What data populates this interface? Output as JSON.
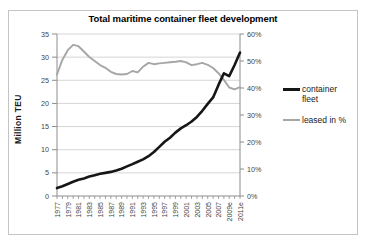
{
  "chart_data": {
    "type": "line",
    "title": "Total maritime container fleet development",
    "ylabel_left": "Million TEU",
    "x": [
      1977,
      1978,
      1979,
      1980,
      1981,
      1982,
      1983,
      1984,
      1985,
      1986,
      1987,
      1988,
      1989,
      1990,
      1991,
      1992,
      1993,
      1994,
      1995,
      1996,
      1997,
      1998,
      1999,
      2000,
      2001,
      2002,
      2003,
      2004,
      2005,
      2006,
      2007,
      2008,
      2009,
      2010,
      2011
    ],
    "x_tick_labels": [
      "1977",
      "1979",
      "1981",
      "1983",
      "1985",
      "1987",
      "1989",
      "1991",
      "1993",
      "1995",
      "1997",
      "1999",
      "2001",
      "2003",
      "2005",
      "2007",
      "2009e",
      "2011e"
    ],
    "left_axis": {
      "min": 0,
      "max": 35,
      "ticks": [
        0,
        5,
        10,
        15,
        20,
        25,
        30,
        35
      ],
      "suffix": ""
    },
    "right_axis": {
      "min": 0,
      "max": 60,
      "ticks": [
        0,
        10,
        20,
        30,
        40,
        50,
        60
      ],
      "suffix": "%"
    },
    "grid": true,
    "legend_position": "right",
    "series": [
      {
        "name": "container fleet",
        "axis": "left",
        "color": "#161616",
        "stroke_width": 2.6,
        "values": [
          1.7,
          2.1,
          2.6,
          3.1,
          3.5,
          3.8,
          4.2,
          4.5,
          4.8,
          5.0,
          5.2,
          5.5,
          5.9,
          6.4,
          6.9,
          7.4,
          7.9,
          8.6,
          9.5,
          10.6,
          11.7,
          12.6,
          13.7,
          14.6,
          15.3,
          16.1,
          17.1,
          18.4,
          19.9,
          21.3,
          24.0,
          26.5,
          25.9,
          28.3,
          31.0
        ]
      },
      {
        "name": "leased in %",
        "axis": "right",
        "color": "#a6a6a6",
        "stroke_width": 1.9,
        "values": [
          45,
          50.5,
          54,
          56,
          55.5,
          53.5,
          51.5,
          50,
          48.5,
          47.5,
          46,
          45.2,
          45,
          45.2,
          46.3,
          45.8,
          47.9,
          49.3,
          48.8,
          49.1,
          49.3,
          49.5,
          49.7,
          50,
          49.5,
          48.5,
          48.8,
          49.3,
          48.6,
          47.4,
          45.5,
          43,
          40.2,
          39.5,
          40.3
        ]
      }
    ]
  },
  "colors": {
    "grid": "#d6d6d6",
    "axis": "#8c8c8c",
    "tick_text": "#3f3f3f",
    "frame_border": "#c4c4c4",
    "background": "#ffffff"
  }
}
